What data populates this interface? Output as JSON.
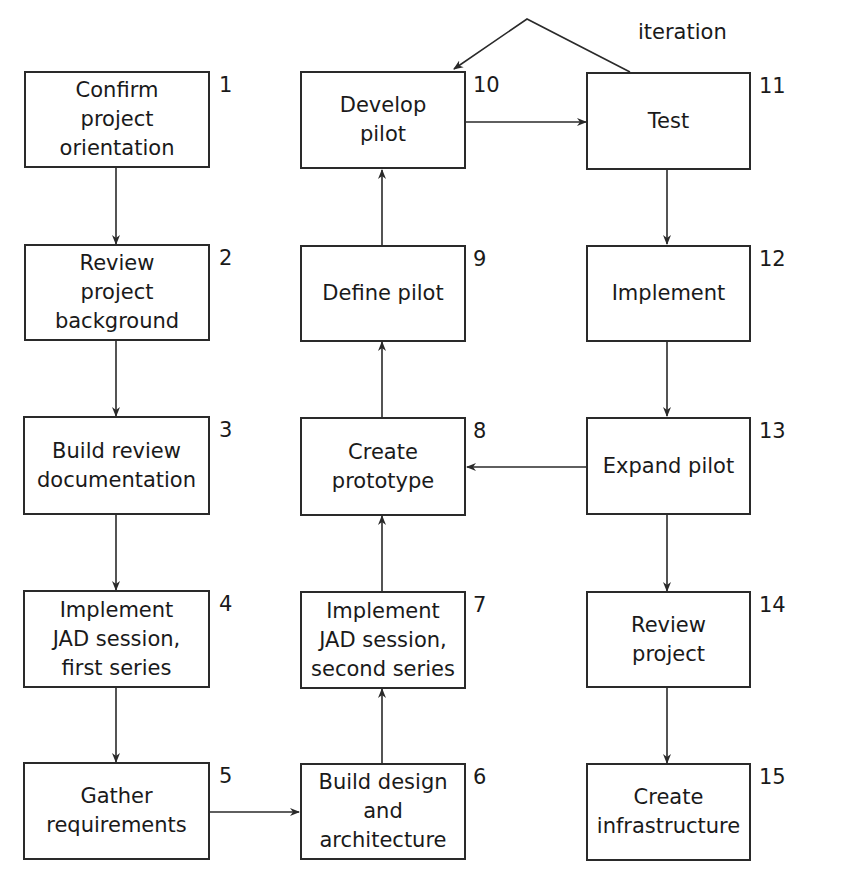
{
  "diagram": {
    "type": "process-flowchart",
    "annotation": {
      "iteration_label": "iteration"
    },
    "steps": [
      {
        "number": "1",
        "label": "Confirm project orientation",
        "lines": [
          "Confirm",
          "project",
          "orientation"
        ]
      },
      {
        "number": "2",
        "label": "Review project background",
        "lines": [
          "Review",
          "project",
          "background"
        ]
      },
      {
        "number": "3",
        "label": "Build review documentation",
        "lines": [
          "Build review",
          "documentation"
        ]
      },
      {
        "number": "4",
        "label": "Implement JAD session, first series",
        "lines": [
          "Implement",
          "JAD session,",
          "first series"
        ]
      },
      {
        "number": "5",
        "label": "Gather requirements",
        "lines": [
          "Gather",
          "requirements"
        ]
      },
      {
        "number": "6",
        "label": "Build design and architecture",
        "lines": [
          "Build design",
          "and",
          "architecture"
        ]
      },
      {
        "number": "7",
        "label": "Implement JAD session, second series",
        "lines": [
          "Implement",
          "JAD session,",
          "second series"
        ]
      },
      {
        "number": "8",
        "label": "Create prototype",
        "lines": [
          "Create",
          "prototype"
        ]
      },
      {
        "number": "9",
        "label": "Define pilot",
        "lines": [
          "Define pilot"
        ]
      },
      {
        "number": "10",
        "label": "Develop pilot",
        "lines": [
          "Develop",
          "pilot"
        ]
      },
      {
        "number": "11",
        "label": "Test",
        "lines": [
          "Test"
        ]
      },
      {
        "number": "12",
        "label": "Implement",
        "lines": [
          "Implement"
        ]
      },
      {
        "number": "13",
        "label": "Expand pilot",
        "lines": [
          "Expand pilot"
        ]
      },
      {
        "number": "14",
        "label": "Review project",
        "lines": [
          "Review",
          "project"
        ]
      },
      {
        "number": "15",
        "label": "Create infrastructure",
        "lines": [
          "Create",
          "infrastructure"
        ]
      }
    ],
    "edges": [
      {
        "from": "1",
        "to": "2"
      },
      {
        "from": "2",
        "to": "3"
      },
      {
        "from": "3",
        "to": "4"
      },
      {
        "from": "4",
        "to": "5"
      },
      {
        "from": "5",
        "to": "6"
      },
      {
        "from": "6",
        "to": "7"
      },
      {
        "from": "7",
        "to": "8"
      },
      {
        "from": "8",
        "to": "9"
      },
      {
        "from": "9",
        "to": "10"
      },
      {
        "from": "10",
        "to": "11"
      },
      {
        "from": "11",
        "to": "10",
        "label": "iteration"
      },
      {
        "from": "11",
        "to": "12"
      },
      {
        "from": "12",
        "to": "13"
      },
      {
        "from": "13",
        "to": "8"
      },
      {
        "from": "13",
        "to": "14"
      },
      {
        "from": "14",
        "to": "15"
      }
    ],
    "colors": {
      "line": "#2a2a2a",
      "text": "#1a1a1a",
      "background": "#ffffff"
    }
  }
}
